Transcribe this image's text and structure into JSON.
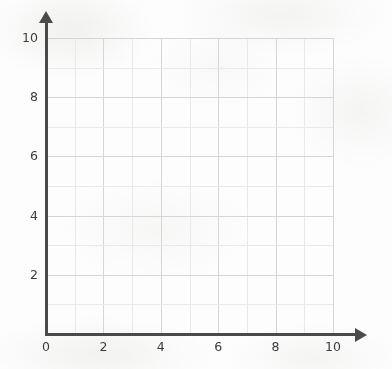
{
  "chart_data": {
    "type": "scatter",
    "title": "",
    "subtitle": "",
    "xlabel": "",
    "ylabel": "",
    "xlim": [
      0,
      10
    ],
    "ylim": [
      0,
      10
    ],
    "x_tick_labels": [
      "0",
      "2",
      "4",
      "6",
      "8",
      "10"
    ],
    "y_tick_labels": [
      "0",
      "2",
      "4",
      "6",
      "8",
      "10"
    ],
    "x_tick_values": [
      0,
      2,
      4,
      6,
      8,
      10
    ],
    "y_tick_values": [
      0,
      2,
      4,
      6,
      8,
      10
    ],
    "x_minor_step": 1,
    "y_minor_step": 1,
    "grid": true,
    "legend": null,
    "series": [],
    "annotations": []
  },
  "axes": {
    "y_axis_name": "y-axis",
    "x_axis_name": "x-axis",
    "arrow_y_name": "y-axis-arrowhead",
    "arrow_x_name": "x-axis-arrowhead"
  },
  "colors": {
    "background": "#fdfdfd",
    "axis": "#4a4a4a",
    "grid_minor": "#e9e9ea",
    "grid_major": "#d6d6d8",
    "tick_text": "#3c3c3c"
  }
}
